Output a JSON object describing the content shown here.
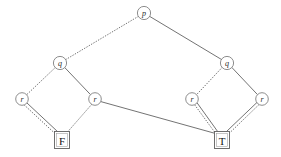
{
  "figure": {
    "kind": "binary-decision-diagram",
    "width": 281,
    "height": 157,
    "background_color": "#ffffff",
    "edge_solid_color": "#5a5a5a",
    "edge_dotted_color": "#6b6b6b",
    "node_stroke_color": "#707070",
    "node_fill_color": "#ffffff",
    "terminal_stroke_color": "#5f5f5f",
    "label_color": "#2a2a2a"
  },
  "nodes": [
    {
      "id": "p",
      "label": "p",
      "x": 144,
      "y": 13,
      "r": 6.6,
      "shape": "circle"
    },
    {
      "id": "q1",
      "label": "q",
      "x": 60,
      "y": 63,
      "r": 6.6,
      "shape": "circle"
    },
    {
      "id": "q2",
      "label": "q",
      "x": 227,
      "y": 63,
      "r": 6.6,
      "shape": "circle"
    },
    {
      "id": "r1",
      "label": "r",
      "x": 22,
      "y": 99,
      "r": 6.3,
      "shape": "circle"
    },
    {
      "id": "r2",
      "label": "r",
      "x": 95,
      "y": 99,
      "r": 6.3,
      "shape": "circle"
    },
    {
      "id": "r3",
      "label": "r",
      "x": 192,
      "y": 99,
      "r": 6.3,
      "shape": "circle"
    },
    {
      "id": "r4",
      "label": "r",
      "x": 262,
      "y": 99,
      "r": 6.3,
      "shape": "circle"
    }
  ],
  "terminals": [
    {
      "id": "F",
      "label": "F",
      "x": 62,
      "y": 140,
      "w": 15,
      "h": 17,
      "shape": "box"
    },
    {
      "id": "T",
      "label": "T",
      "x": 222,
      "y": 140,
      "w": 15,
      "h": 17,
      "shape": "box"
    }
  ],
  "edges": [
    {
      "id": "p-low",
      "from": "p",
      "to": "q1",
      "style": "dotted",
      "branch": "0"
    },
    {
      "id": "p-high",
      "from": "p",
      "to": "q2",
      "style": "solid",
      "branch": "1"
    },
    {
      "id": "q1-low",
      "from": "q1",
      "to": "r1",
      "style": "dotted",
      "branch": "0"
    },
    {
      "id": "q1-high",
      "from": "q1",
      "to": "r2",
      "style": "solid",
      "branch": "1"
    },
    {
      "id": "q2-low",
      "from": "q2",
      "to": "r3",
      "style": "dotted",
      "branch": "0"
    },
    {
      "id": "q2-high",
      "from": "q2",
      "to": "r4",
      "style": "solid",
      "branch": "1"
    },
    {
      "id": "r1-low",
      "from": "r1",
      "to": "F",
      "style": "dotted",
      "branch": "0"
    },
    {
      "id": "r1-high",
      "from": "r1",
      "to": "F",
      "style": "solid",
      "branch": "1"
    },
    {
      "id": "r2-low",
      "from": "r2",
      "to": "F",
      "style": "dotted",
      "branch": "0"
    },
    {
      "id": "r2-high",
      "from": "r2",
      "to": "T",
      "style": "solid",
      "branch": "1"
    },
    {
      "id": "r3-low",
      "from": "r3",
      "to": "T",
      "style": "dotted",
      "branch": "0"
    },
    {
      "id": "r3-high",
      "from": "r3",
      "to": "T",
      "style": "solid",
      "branch": "1"
    },
    {
      "id": "r4-low",
      "from": "r4",
      "to": "T",
      "style": "dotted",
      "branch": "0"
    },
    {
      "id": "r4-high",
      "from": "r4",
      "to": "T",
      "style": "solid",
      "branch": "1"
    }
  ],
  "edge_geometry": {
    "p-low": {
      "x1": 138.3,
      "y1": 16.4,
      "x2": 65.7,
      "y2": 59.6
    },
    "p-high": {
      "x1": 149.7,
      "y1": 16.4,
      "x2": 221.5,
      "y2": 59.5
    },
    "q1-low": {
      "x1": 55.2,
      "y1": 67.6,
      "x2": 26.9,
      "y2": 94.5
    },
    "q1-high": {
      "x1": 64.8,
      "y1": 67.6,
      "x2": 90.3,
      "y2": 94.4
    },
    "q2-low": {
      "x1": 222.0,
      "y1": 67.6,
      "x2": 196.8,
      "y2": 94.4
    },
    "q2-high": {
      "x1": 232.0,
      "y1": 67.6,
      "x2": 257.3,
      "y2": 94.4
    },
    "r1-low": {
      "x1": 24.5,
      "y1": 105.2,
      "x2": 55.5,
      "y2": 134.0
    },
    "r1-high": {
      "x1": 27.0,
      "y1": 103.0,
      "x2": 58.0,
      "y2": 132.0
    },
    "r2-low": {
      "x1": 91.5,
      "y1": 104.6,
      "x2": 67.5,
      "y2": 132.0
    },
    "r2-high": {
      "x1": 100.8,
      "y1": 101.6,
      "x2": 215.5,
      "y2": 133.5
    },
    "r3-low": {
      "x1": 194.8,
      "y1": 105.0,
      "x2": 216.0,
      "y2": 134.0
    },
    "r3-high": {
      "x1": 197.2,
      "y1": 103.0,
      "x2": 218.0,
      "y2": 132.0
    },
    "r4-low": {
      "x1": 259.0,
      "y1": 104.6,
      "x2": 228.5,
      "y2": 134.0
    },
    "r4-high": {
      "x1": 256.8,
      "y1": 102.6,
      "x2": 226.0,
      "y2": 132.0
    }
  }
}
